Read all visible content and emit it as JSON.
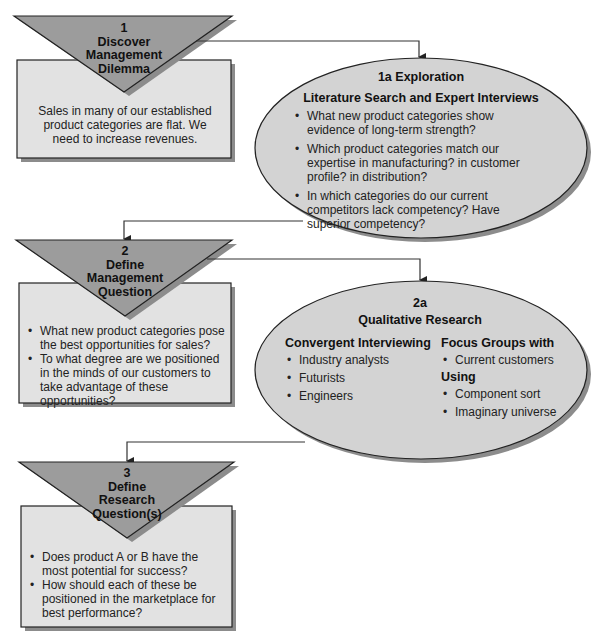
{
  "colors": {
    "triangle_fill": "#9c9c9c",
    "box_fill": "#e2e2e2",
    "ellipse_fill": "#d3d3d3",
    "shadow": "#8c8c8c",
    "stroke": "#222222",
    "connector": "#333333"
  },
  "step1": {
    "number": "1",
    "title_line1": "Discover",
    "title_line2": "Management",
    "title_line3": "Dilemma",
    "body": "Sales in many of our established product categories are flat. We need to increase revenues."
  },
  "step1a": {
    "title": "1a Exploration",
    "subtitle": "Literature Search and Expert Interviews",
    "bullets": [
      "What new product categories show evidence of long-term strength?",
      "Which product categories match our expertise in manufacturing? in customer profile? in distribution?",
      "In which categories do our current competitors lack competency? Have superior competency?"
    ]
  },
  "step2": {
    "number": "2",
    "title_line1": "Define",
    "title_line2": "Management",
    "title_line3": "Question",
    "bullets": [
      "What new product categories pose the best opportunities for sales?",
      "To what degree are we positioned in the minds of our customers to take advantage of these opportunities?"
    ]
  },
  "step2a": {
    "number": "2a",
    "title": "Qualitative Research",
    "left_heading": "Convergent Interviewing",
    "left_items": [
      "Industry analysts",
      "Futurists",
      "Engineers"
    ],
    "right_heading": "Focus Groups with",
    "right_items_1": [
      "Current customers"
    ],
    "right_heading_2": "Using",
    "right_items_2": [
      "Component sort",
      "Imaginary universe"
    ]
  },
  "step3": {
    "number": "3",
    "title_line1": "Define",
    "title_line2": "Research",
    "title_line3": "Question(s)",
    "bullets": [
      "Does product A or B have the most potential for success?",
      "How should each of these be positioned in the marketplace for best performance?"
    ]
  }
}
